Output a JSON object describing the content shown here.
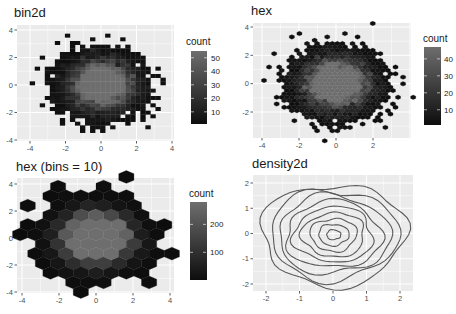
{
  "chart_data": [
    {
      "type": "heatmap",
      "title": "bin2d",
      "xlabel": "",
      "ylabel": "",
      "xlim": [
        -4.5,
        4.2
      ],
      "ylim": [
        -4.2,
        4.2
      ],
      "x_ticks": [
        "-4",
        "-2",
        "0",
        "2",
        "4"
      ],
      "y_ticks": [
        "4",
        "2",
        "0",
        "-2",
        "-4"
      ],
      "legend": {
        "title": "count",
        "ticks": [
          "50",
          "40",
          "30",
          "20",
          "10"
        ],
        "range": [
          1,
          55
        ],
        "position": "right"
      },
      "grid": true,
      "description": "2D rectangular bins of bivariate normal sample; dense dark blob centered at (0,0), lighter center up to ~55 counts"
    },
    {
      "type": "heatmap",
      "title": "hex",
      "xlabel": "",
      "ylabel": "",
      "xlim": [
        -4.3,
        3.9
      ],
      "ylim": [
        -3.9,
        4.1
      ],
      "x_ticks": [
        "-4",
        "-2",
        "0",
        "2"
      ],
      "y_ticks": [
        "4",
        "2",
        "0",
        "-2"
      ],
      "legend": {
        "title": "count",
        "ticks": [
          "40",
          "30",
          "20",
          "10"
        ],
        "range": [
          1,
          47
        ],
        "position": "right"
      },
      "grid": true,
      "description": "Hexagonal bins (default bins) of the same sample, max ~47 counts"
    },
    {
      "type": "heatmap",
      "title": "hex (bins = 10)",
      "xlabel": "",
      "ylabel": "",
      "xlim": [
        -4.2,
        4.2
      ],
      "ylim": [
        -4.2,
        4.3
      ],
      "x_ticks": [
        "-4",
        "-2",
        "0",
        "2",
        "4"
      ],
      "y_ticks": [
        "4",
        "2",
        "0",
        "-2",
        "-4"
      ],
      "legend": {
        "title": "count",
        "ticks": [
          "200",
          "100"
        ],
        "range": [
          1,
          280
        ],
        "position": "right"
      },
      "grid": true,
      "description": "Hexagonal bins with 10 bins; large hexagons, brightest near center (~250+)"
    },
    {
      "type": "line",
      "subtype": "contour",
      "title": "density2d",
      "xlabel": "",
      "ylabel": "",
      "xlim": [
        -2.3,
        2.3
      ],
      "ylim": [
        -2.1,
        2.1
      ],
      "x_ticks": [
        "-2",
        "-1",
        "0",
        "1",
        "2"
      ],
      "y_ticks": [
        "2",
        "1",
        "0",
        "-1",
        "-2"
      ],
      "contour_levels": 9,
      "grid": true,
      "description": "2D kernel density contour lines, concentric irregular rings centered near (0,0)"
    }
  ],
  "panels": {
    "p1": {
      "title": "bin2d",
      "legend_title": "count"
    },
    "p2": {
      "title": "hex",
      "legend_title": "count"
    },
    "p3": {
      "title": "hex (bins = 10)",
      "legend_title": "count"
    },
    "p4": {
      "title": "density2d"
    }
  },
  "colors": {
    "panel_bg": "#ebebeb",
    "grid": "#ffffff",
    "low": "#132b43",
    "high": "#56b1f7",
    "low_gray": "#0d0d0d",
    "high_gray": "#6e6e6e",
    "line": "#595959"
  }
}
